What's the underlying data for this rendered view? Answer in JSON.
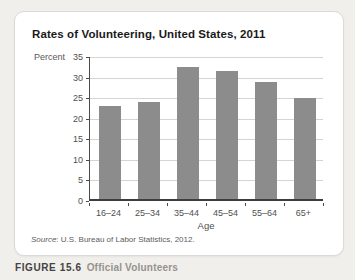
{
  "figure": {
    "title": "Rates of Volunteering, United States, 2011",
    "source_word": "Source",
    "source_rest": ": U.S. Bureau of Labor Statistics, 2012.",
    "caption_label": "FIGURE 15.6",
    "caption_title": "Official Volunteers"
  },
  "chart_data": {
    "type": "bar",
    "title": "Rates of Volunteering, United States, 2011",
    "categories": [
      "16–24",
      "25–34",
      "35–44",
      "45–54",
      "55–64",
      "65+"
    ],
    "values": [
      22.5,
      23.5,
      32,
      31,
      28.5,
      24.5
    ],
    "xlabel": "Age",
    "ylabel": "Percent",
    "ylim": [
      0,
      35
    ],
    "yticks": [
      0,
      5,
      10,
      15,
      20,
      25,
      30,
      35
    ],
    "grid": true,
    "legend": "none",
    "bar_color": "#8c8c8c",
    "grid_color": "#d4d4d4",
    "axis_color": "#4a4a4a"
  }
}
